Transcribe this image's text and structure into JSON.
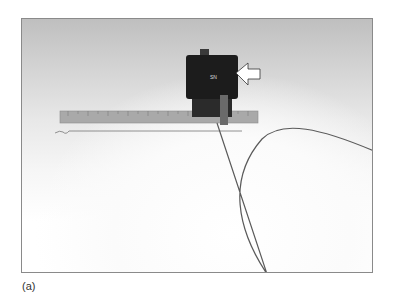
{
  "figure": {
    "caption_label": "(a)",
    "photo_description": "Black sensor box with connector, white arrow pointing at box, steel ruler, and looping thin wire/fiber on white background",
    "box_label": "SN",
    "colors": {
      "box": "#1c1c1c",
      "ruler": "#a8a8a8",
      "wire": "#555555",
      "frame_border": "#8a8a8a"
    }
  }
}
